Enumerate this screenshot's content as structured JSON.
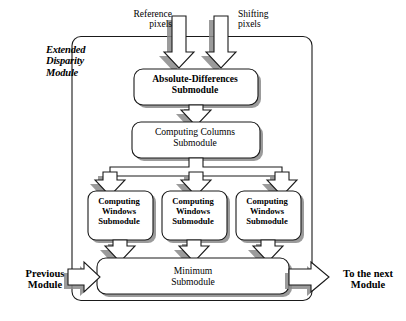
{
  "diagram": {
    "type": "block-diagram",
    "module_label": "Extended\nDisparity\nModule",
    "colors": {
      "stroke": "#1a1a1a",
      "shadow": "#8a8a8a",
      "fill": "#ffffff",
      "background": "#ffffff"
    },
    "inputs": [
      {
        "id": "reference",
        "label": "Reference\npixels"
      },
      {
        "id": "shifting",
        "label": "Shifting\npixels"
      }
    ],
    "side_ports": [
      {
        "id": "previous",
        "label": "Previous\nModule",
        "side": "left"
      },
      {
        "id": "next",
        "label": "To the next\nModule",
        "side": "right"
      }
    ],
    "blocks": [
      {
        "id": "absolute-differences",
        "label": "Absolute-Differences\nSubmodule"
      },
      {
        "id": "computing-columns",
        "label": "Computing Columns\nSubmodule"
      },
      {
        "id": "computing-windows-1",
        "label": "Computing\nWindows\nSubmodule"
      },
      {
        "id": "computing-windows-2",
        "label": "Computing\nWindows\nSubmodule"
      },
      {
        "id": "computing-windows-3",
        "label": "Computing\nWindows\nSubmodule"
      },
      {
        "id": "minimum",
        "label": "Minimum\nSubmodule"
      }
    ]
  }
}
